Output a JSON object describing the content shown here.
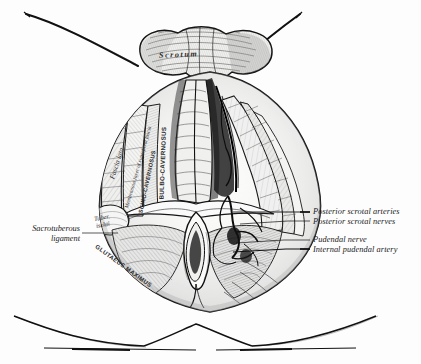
{
  "figure": {
    "background_color": "#fdfdfd",
    "ink_color": "#1a1a1a"
  },
  "labels_right": [
    {
      "text": "Posterior scrotal arteries",
      "x": 313,
      "y": 208,
      "leader_from_x": 233,
      "leader_to_x": 310,
      "leader_y": 212
    },
    {
      "text": "Posterior scrotal nerves",
      "x": 313,
      "y": 218,
      "leader_from_x": 240,
      "leader_to_x": 310,
      "leader_y": 221
    },
    {
      "text": "Pudendal nerve",
      "x": 313,
      "y": 236,
      "leader_from_x": 236,
      "leader_to_x": 310,
      "leader_y": 239
    },
    {
      "text": "Internal pudendal artery",
      "x": 313,
      "y": 246,
      "leader_from_x": 233,
      "leader_to_x": 310,
      "leader_y": 249
    }
  ],
  "labels_left": [
    {
      "line1": "Sacrotuberous",
      "line2": "ligament",
      "x": 12,
      "y": 228,
      "leader_from_x": 82,
      "leader_to_x": 118,
      "leader_y": 233
    }
  ],
  "labels_in_figure": [
    {
      "text": "Scrotum",
      "style": "italic-spaced",
      "x": 159,
      "y": 56,
      "rotate": -2
    },
    {
      "text": "Fascia lata",
      "style": "italic",
      "x": 112,
      "y": 175,
      "rotate": -72,
      "size": 7.2
    },
    {
      "text": "Membranous layer of superficial fascia",
      "style": "italic",
      "x": 126,
      "y": 205,
      "rotate": -74,
      "size": 5.4
    },
    {
      "text": "ISCHIO-CAVERNOSUS",
      "style": "caps",
      "x": 140,
      "y": 212,
      "rotate": -78,
      "size": 5.6
    },
    {
      "text": "BULBO-CAVERNOSUS",
      "style": "caps",
      "x": 161,
      "y": 196,
      "rotate": -88,
      "size": 6.2
    },
    {
      "text": "Tuber.",
      "style": "italic",
      "x": 94,
      "y": 215,
      "rotate": -10,
      "size": 6.4
    },
    {
      "text": "ischii",
      "style": "italic",
      "x": 96,
      "y": 222,
      "rotate": -10,
      "size": 6.4
    },
    {
      "text": "GLUTAEUS MAXIMUS",
      "style": "caps",
      "x": 96,
      "y": 243,
      "rotate": 36,
      "size": 6.0
    }
  ]
}
